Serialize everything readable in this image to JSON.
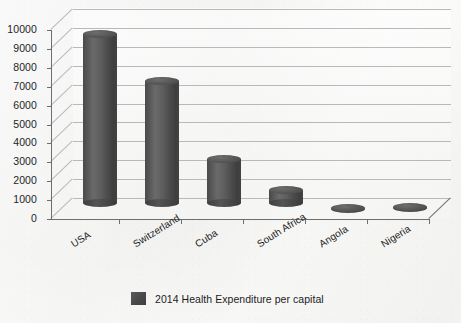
{
  "chart_data": {
    "type": "bar",
    "title": "",
    "subtitle": "",
    "xlabel": "",
    "ylabel": "",
    "categories": [
      "USA",
      "Switzerland",
      "Cuba",
      "South Africa",
      "Angola",
      "Nigeria"
    ],
    "series": [
      {
        "name": "2014 Health Expenditure per capital",
        "values": [
          9400,
          6900,
          2800,
          1150,
          200,
          220
        ]
      }
    ],
    "values": [
      9400,
      6900,
      2800,
      1150,
      200,
      220
    ],
    "ylim": [
      0,
      10000
    ],
    "ytick_labels": [
      "10000",
      "9000",
      "8000",
      "7000",
      "6000",
      "5000",
      "4000",
      "3000",
      "2000",
      "1000",
      "0"
    ],
    "ytick_values": [
      10000,
      9000,
      8000,
      7000,
      6000,
      5000,
      4000,
      3000,
      2000,
      1000,
      0
    ],
    "grid": true,
    "legend_position": "bottom",
    "render_style": "3d-cylinder",
    "bar_color": "#4d4d4d",
    "gridline_color": "#b9b9b9",
    "axis_color": "#6f6f6f",
    "background_color": "#f7f7f6"
  },
  "legend": {
    "entries": [
      {
        "label": "2014 Health Expenditure per capital",
        "color": "#4d4d4d"
      }
    ]
  }
}
